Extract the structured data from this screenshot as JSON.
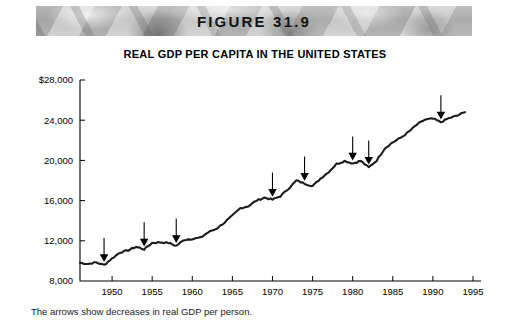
{
  "banner": {
    "figure_label": "FIGURE 31.9"
  },
  "caption": "The arrows show decreases in real GDP per person.",
  "chart_data": {
    "type": "line",
    "title": "REAL GDP PER CAPITA IN THE UNITED STATES",
    "xlabel": "",
    "ylabel": "",
    "grid": false,
    "legend": "none",
    "xlim": [
      1946,
      1996
    ],
    "ylim": [
      8000,
      28000
    ],
    "ytick_labels": [
      "$28,000",
      "24,000",
      "20,000",
      "16,000",
      "12,000",
      "8,000"
    ],
    "yticks": [
      28000,
      24000,
      20000,
      16000,
      12000,
      8000
    ],
    "xticks": [
      1950,
      1955,
      1960,
      1965,
      1970,
      1975,
      1980,
      1985,
      1990,
      1995
    ],
    "xtick_labels": [
      "1950",
      "1955",
      "1960",
      "1965",
      "1970",
      "1975",
      "1980",
      "1985",
      "1990",
      "1995"
    ],
    "series": [
      {
        "name": "Real GDP per capita",
        "x": [
          1946,
          1947,
          1948,
          1949,
          1950,
          1951,
          1952,
          1953,
          1954,
          1955,
          1956,
          1957,
          1958,
          1959,
          1960,
          1961,
          1962,
          1963,
          1964,
          1965,
          1966,
          1967,
          1968,
          1969,
          1970,
          1971,
          1972,
          1973,
          1974,
          1975,
          1976,
          1977,
          1978,
          1979,
          1980,
          1981,
          1982,
          1983,
          1984,
          1985,
          1986,
          1987,
          1988,
          1989,
          1990,
          1991,
          1992,
          1993,
          1994
        ],
        "values": [
          9800,
          9700,
          9850,
          9600,
          10250,
          10850,
          11050,
          11400,
          11150,
          11800,
          11850,
          11800,
          11500,
          12100,
          12200,
          12300,
          12850,
          13200,
          13800,
          14500,
          15250,
          15450,
          16000,
          16300,
          16100,
          16450,
          17200,
          18000,
          17700,
          17450,
          18200,
          18850,
          19650,
          19950,
          19700,
          19950,
          19300,
          20000,
          21200,
          21800,
          22250,
          22850,
          23550,
          24050,
          24150,
          23800,
          24200,
          24450,
          24800
        ]
      }
    ],
    "annotations": [
      {
        "type": "arrow",
        "label": "decrease-1949",
        "year": 1949,
        "value": 9600
      },
      {
        "type": "arrow",
        "label": "decrease-1954",
        "year": 1954,
        "value": 11150
      },
      {
        "type": "arrow",
        "label": "decrease-1958",
        "year": 1958,
        "value": 11500
      },
      {
        "type": "arrow",
        "label": "decrease-1970",
        "year": 1970,
        "value": 16100
      },
      {
        "type": "arrow",
        "label": "decrease-1974",
        "year": 1974,
        "value": 17700
      },
      {
        "type": "arrow",
        "label": "decrease-1980",
        "year": 1980,
        "value": 19700
      },
      {
        "type": "arrow",
        "label": "decrease-1982",
        "year": 1982,
        "value": 19300
      },
      {
        "type": "arrow",
        "label": "decrease-1991",
        "year": 1991,
        "value": 23800
      }
    ]
  }
}
